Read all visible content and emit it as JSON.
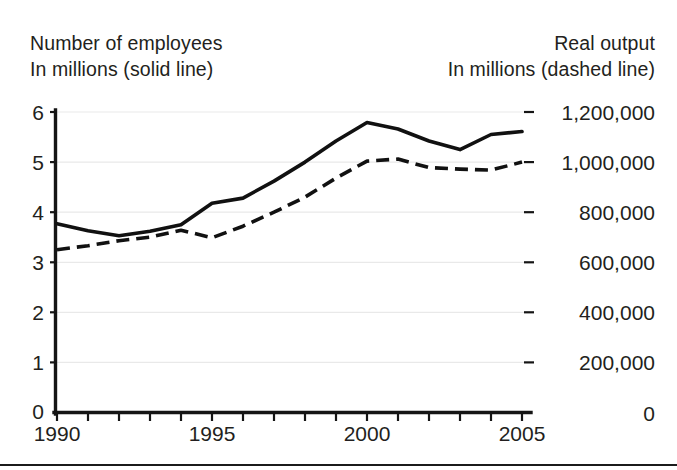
{
  "header": {
    "left_line1": "Number of employees",
    "left_line2": "In millions (solid line)",
    "right_line1": "Real output",
    "right_line2": "In millions (dashed line)"
  },
  "colors": {
    "line": "#111111",
    "grid": "#e9e9e9",
    "axis": "#151515",
    "text": "#231f20",
    "background": "#ffffff"
  },
  "chart_data": {
    "type": "line",
    "title": "",
    "xlabel": "",
    "ylabel": "Number of employees, In millions (solid line)",
    "y2label": "Real output, In millions (dashed line)",
    "grid": true,
    "legend_position": "above-plot-as-axis-captions",
    "x": [
      1990,
      1991,
      1992,
      1993,
      1994,
      1995,
      1996,
      1997,
      1998,
      1999,
      2000,
      2001,
      2002,
      2003,
      2004,
      2005
    ],
    "xlim": [
      1990,
      2005
    ],
    "xticks": [
      1990,
      1991,
      1992,
      1993,
      1994,
      1995,
      1996,
      1997,
      1998,
      1999,
      2000,
      2001,
      2002,
      2003,
      2004,
      2005
    ],
    "xticklabels": [
      "1990",
      "",
      "",
      "",
      "",
      "1995",
      "",
      "",
      "",
      "",
      "2000",
      "",
      "",
      "",
      "",
      "2005"
    ],
    "xticklabels_shown": [
      "1990",
      "1995",
      "2000",
      "2005"
    ],
    "ylim": [
      0,
      6
    ],
    "yticks": [
      0,
      1,
      2,
      3,
      4,
      5,
      6
    ],
    "yticklabels": [
      "0",
      "1",
      "2",
      "3",
      "4",
      "5",
      "6"
    ],
    "y2lim": [
      0,
      1200000
    ],
    "y2ticks": [
      0,
      200000,
      400000,
      600000,
      800000,
      1000000,
      1200000
    ],
    "y2ticklabels": [
      "0",
      "200,000",
      "400,000",
      "600,000",
      "800,000",
      "1,000,000",
      "1,200,000"
    ],
    "series": [
      {
        "name": "Number of employees (millions)",
        "style": "solid",
        "axis": "left",
        "values": [
          3.77,
          3.63,
          3.53,
          3.62,
          3.75,
          4.18,
          4.28,
          4.62,
          5.0,
          5.42,
          5.79,
          5.66,
          5.42,
          5.25,
          5.55,
          5.61
        ]
      },
      {
        "name": "Real output (millions)",
        "style": "dashed",
        "axis": "right",
        "values_left_scale": [
          3.25,
          3.33,
          3.43,
          3.5,
          3.64,
          3.49,
          3.72,
          4.0,
          4.3,
          4.68,
          5.02,
          5.06,
          4.89,
          4.86,
          4.84,
          5.0
        ],
        "values": [
          650000,
          666000,
          686000,
          700000,
          728000,
          698000,
          744000,
          800000,
          860000,
          936000,
          1004000,
          1012000,
          978000,
          972000,
          968000,
          1000000
        ]
      }
    ]
  }
}
